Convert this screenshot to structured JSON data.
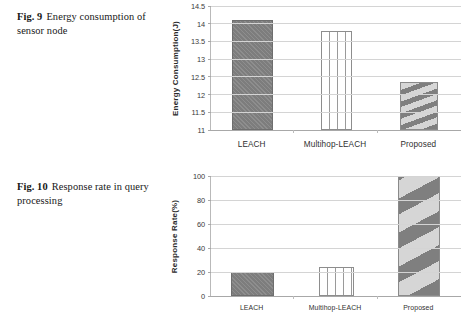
{
  "page": {
    "background": "#ffffff",
    "figures": [
      {
        "id": "figure-9",
        "caption": {
          "label": "Fig. 9",
          "text": "Energy consumption of sensor node"
        }
      },
      {
        "id": "figure-10",
        "caption": {
          "label": "Fig. 10",
          "text": "Response rate in query processing"
        }
      }
    ]
  },
  "chart_data": [
    {
      "id": "chart-9",
      "type": "bar",
      "title": "",
      "xlabel": "",
      "ylabel": "Energy Consumption(J)",
      "categories": [
        "LEACH",
        "Multihop-LEACH",
        "Proposed"
      ],
      "values": [
        14.1,
        13.8,
        12.35
      ],
      "ylim": [
        11,
        14.5
      ],
      "yticks": [
        11,
        11.5,
        12,
        12.5,
        13,
        13.5,
        14,
        14.5
      ],
      "ytick_labels": [
        "11",
        "11.5",
        "12",
        "12.5",
        "13",
        "13.5",
        "14",
        "14.5"
      ],
      "grid": true,
      "legend": false,
      "bar_fills": [
        "solid-gray",
        "white-vertical-lines",
        "diagonal-stripes"
      ],
      "colors": {
        "bar_gray": "#7d7d7d",
        "bar_white": "#ffffff",
        "bar_stripe_dark": "#7f7f7f",
        "bar_stripe_light": "#d6d6d6",
        "grid": "#d4d4d4",
        "axis": "#a8a8a8"
      }
    },
    {
      "id": "chart-10",
      "type": "bar",
      "title": "",
      "xlabel": "",
      "ylabel": "Response Rate(%)",
      "categories": [
        "LEACH",
        "Multihop-LEACH",
        "Proposed"
      ],
      "values": [
        20,
        24,
        100
      ],
      "ylim": [
        0,
        100
      ],
      "yticks": [
        0,
        20,
        40,
        60,
        80,
        100
      ],
      "ytick_labels": [
        "0",
        "20",
        "40",
        "60",
        "80",
        "100"
      ],
      "grid": true,
      "legend": false,
      "bar_fills": [
        "solid-gray",
        "white-vertical-lines",
        "diagonal-stripes"
      ],
      "colors": {
        "bar_gray": "#7d7d7d",
        "bar_white": "#ffffff",
        "bar_stripe_dark": "#7f7f7f",
        "bar_stripe_light": "#d6d6d6",
        "grid": "#d4d4d4",
        "axis": "#a8a8a8"
      }
    }
  ]
}
